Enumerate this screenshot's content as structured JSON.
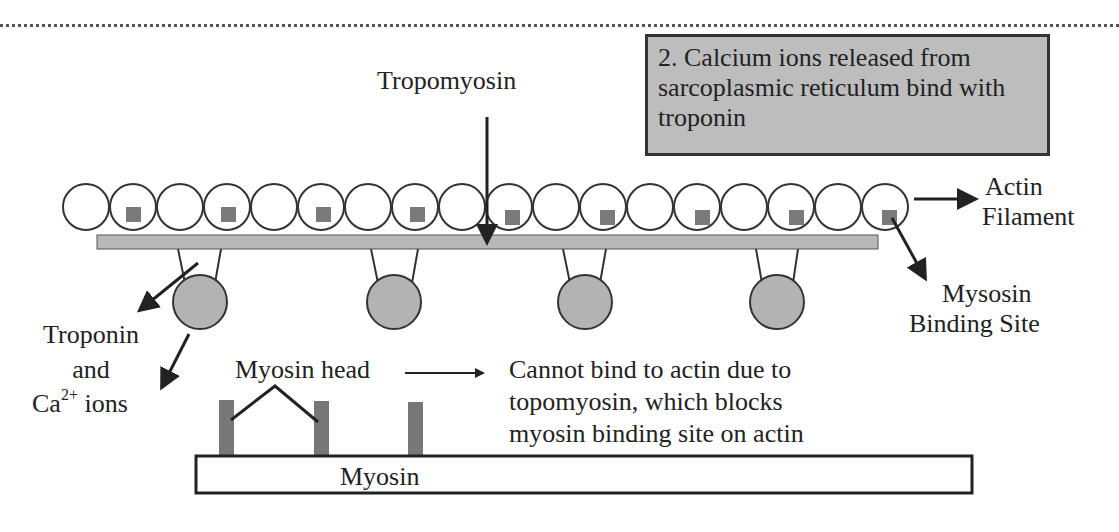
{
  "diagram": {
    "title_callout": "2. Calcium ions released from sarcoplasmic reticulum bind with troponin",
    "labels": {
      "tropomyosin": "Tropomyosin",
      "actin_line1": "Actin",
      "actin_line2": "Filament",
      "binding_site_line1": "Mysosin",
      "binding_site_line2": "Binding Site",
      "troponin_line1": "Troponin",
      "troponin_line2": "and",
      "troponin_line3_prefix": "Ca",
      "troponin_line3_sup": "2+",
      "troponin_line3_suffix": " ions",
      "myosin_head": "Myosin head",
      "cannot_bind_line1": "Cannot bind to actin due to",
      "cannot_bind_line2": "topomyosin, which blocks",
      "cannot_bind_line3": "myosin binding site on actin",
      "myosin": "Myosin"
    },
    "components": {
      "actin_subunit_count": 17,
      "binding_site_count": 9,
      "troponin_complex_count": 4,
      "myosin_head_rod_count": 3
    },
    "colors": {
      "callout_fill": "#bdbdbd",
      "tropomyosin_fill": "#b8b8b8",
      "troponin_fill": "#b3b3b3",
      "binding_site_fill": "#7a7a7a",
      "myosin_rod_fill": "#777777",
      "stroke": "#222222"
    }
  }
}
